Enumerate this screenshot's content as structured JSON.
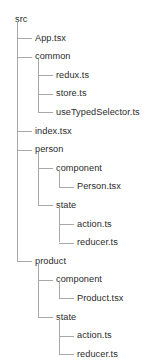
{
  "tree": {
    "root_label": "src",
    "nodes": [
      {
        "label": "src",
        "depth": 0,
        "last": false,
        "type": "folder"
      },
      {
        "label": "App.tsx",
        "depth": 1,
        "last": false,
        "type": "file"
      },
      {
        "label": "common",
        "depth": 1,
        "last": false,
        "type": "folder"
      },
      {
        "label": "redux.ts",
        "depth": 2,
        "last": false,
        "type": "file"
      },
      {
        "label": "store.ts",
        "depth": 2,
        "last": false,
        "type": "file"
      },
      {
        "label": "useTypedSelector.ts",
        "depth": 2,
        "last": true,
        "type": "file"
      },
      {
        "label": "index.tsx",
        "depth": 1,
        "last": false,
        "type": "file"
      },
      {
        "label": "person",
        "depth": 1,
        "last": false,
        "type": "folder"
      },
      {
        "label": "component",
        "depth": 2,
        "last": false,
        "type": "folder"
      },
      {
        "label": "Person.tsx",
        "depth": 3,
        "last": true,
        "type": "file"
      },
      {
        "label": "state",
        "depth": 2,
        "last": true,
        "type": "folder"
      },
      {
        "label": "action.ts",
        "depth": 3,
        "last": false,
        "type": "file"
      },
      {
        "label": "reducer.ts",
        "depth": 3,
        "last": true,
        "type": "file"
      },
      {
        "label": "product",
        "depth": 1,
        "last": true,
        "type": "folder"
      },
      {
        "label": "component",
        "depth": 2,
        "last": false,
        "type": "folder"
      },
      {
        "label": "Product.tsx",
        "depth": 3,
        "last": true,
        "type": "file"
      },
      {
        "label": "state",
        "depth": 2,
        "last": true,
        "type": "folder"
      },
      {
        "label": "action.ts",
        "depth": 3,
        "last": false,
        "type": "file"
      },
      {
        "label": "reducer.ts",
        "depth": 3,
        "last": true,
        "type": "file"
      }
    ],
    "colors": {
      "text": "#2b2b2b",
      "line": "#a8a8a8",
      "background": "#ffffff"
    }
  }
}
